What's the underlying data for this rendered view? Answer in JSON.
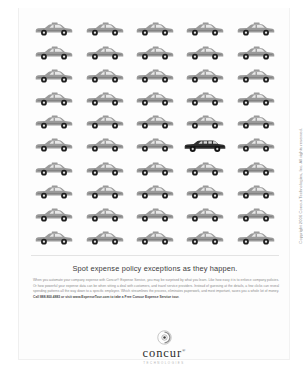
{
  "ad": {
    "headline": "Spot expense policy exceptions as they happen.",
    "body_paragraph": "When you automate your company expense with Concur® Expense Service, you may be surprised by what you learn. Like how easy it is to enforce company policies. Or how powerful your expense data can be when sitting a deal with customers, and travel service providers. Instead of guessing at the details, a few clicks can reveal spending patterns all the way down to a specific employee. Which streamlines the process, eliminates paperwork, and most important, saves you a whole lot of money.",
    "cta": "Call 888.800.4883 or visit www.ExpenseTour.com to take a Free Concur Expense Service tour.",
    "copyright": "Copyright 2006 Concur Technologies, Inc. All rights reserved.",
    "colors": {
      "car_normal": "#9a9a9a",
      "car_exception": "#2f2f2f",
      "headline_text": "#3a3a3a",
      "body_text": "#8a8a8a",
      "page_background": "#ffffff"
    }
  },
  "logo": {
    "mark_name": "concur-circle-mark",
    "wordmark": "concur",
    "registered_mark": "®",
    "tagline": "Technologies"
  },
  "car_grid": {
    "columns": 5,
    "rows": 10,
    "total_cars": 50,
    "exception_row": 6,
    "exception_column": 4,
    "normal_vehicle": "taxi-cab",
    "exception_vehicle": "limousine"
  }
}
